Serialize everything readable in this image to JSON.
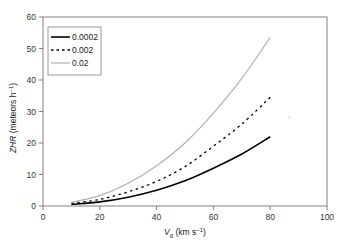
{
  "chart_data": {
    "type": "line",
    "title": "",
    "xlabel": "Vg (km s-1)",
    "xlabel_main": "V",
    "xlabel_sub": "g",
    "xlabel_rest": " (km s",
    "xlabel_sup": "−1",
    "xlabel_end": ")",
    "ylabel": "ZHR (meteors h-1)",
    "ylabel_main": "ZHR",
    "ylabel_rest": " (meteors h",
    "ylabel_sup": "−1",
    "ylabel_end": ")",
    "xlim": [
      0,
      100
    ],
    "ylim": [
      0,
      60
    ],
    "xticks": [
      0,
      20,
      40,
      60,
      80,
      100
    ],
    "yticks": [
      0,
      10,
      20,
      30,
      40,
      50,
      60
    ],
    "grid": false,
    "legend_position": "upper left",
    "x": [
      10,
      20,
      30,
      40,
      50,
      60,
      70,
      80
    ],
    "series": [
      {
        "name": "0.0002",
        "style": "solid",
        "color": "#000000",
        "values": [
          0.5,
          1.3,
          2.8,
          5.0,
          8.0,
          12.0,
          16.5,
          22.0
        ]
      },
      {
        "name": "0.002",
        "style": "dotted",
        "color": "#000000",
        "values": [
          0.8,
          2.1,
          4.5,
          7.8,
          12.5,
          19.0,
          26.0,
          34.5
        ]
      },
      {
        "name": "0.02",
        "style": "solid-light",
        "color": "#b0b0b0",
        "values": [
          1.2,
          3.3,
          7.2,
          12.8,
          20.0,
          29.5,
          40.5,
          53.5
        ]
      }
    ]
  }
}
